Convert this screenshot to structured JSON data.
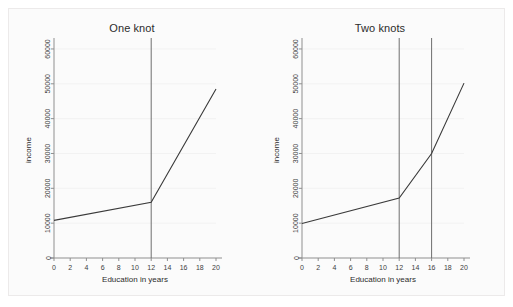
{
  "figure": {
    "background_color": "#fbfbfb",
    "frame_color": "#eceaea",
    "line_color": "#3a3a3a",
    "knot_color": "#6e6e6e",
    "axis_color": "#8f8f8f"
  },
  "panels": [
    {
      "id": "one-knot",
      "title": "One knot"
    },
    {
      "id": "two-knots",
      "title": "Two knots"
    }
  ],
  "axes": {
    "xlabel": "Education in years",
    "ylabel": "income",
    "x_ticks": [
      "0",
      "2",
      "4",
      "6",
      "8",
      "10",
      "12",
      "14",
      "16",
      "18",
      "20"
    ],
    "y_ticks": [
      "0",
      "10000",
      "20000",
      "30000",
      "40000",
      "50000",
      "60000"
    ]
  },
  "chart_data": [
    {
      "type": "line",
      "title": "One knot",
      "xlabel": "Education in years",
      "ylabel": "income",
      "xlim": [
        0,
        20
      ],
      "ylim": [
        0,
        62000
      ],
      "xticks": [
        0,
        2,
        4,
        6,
        8,
        10,
        12,
        14,
        16,
        18,
        20
      ],
      "yticks": [
        0,
        10000,
        20000,
        30000,
        40000,
        50000,
        60000
      ],
      "grid": true,
      "legend": "none",
      "knots": [
        12
      ],
      "series": [
        {
          "name": "piecewise linear spline fit",
          "x": [
            0,
            12,
            20
          ],
          "values": [
            10800,
            16000,
            48500
          ]
        }
      ],
      "annotations": [
        {
          "kind": "vertical-reference-line",
          "x": 12,
          "label": "knot at 12 years"
        }
      ]
    },
    {
      "type": "line",
      "title": "Two knots",
      "xlabel": "Education in years",
      "ylabel": "income",
      "xlim": [
        0,
        20
      ],
      "ylim": [
        0,
        62000
      ],
      "xticks": [
        0,
        2,
        4,
        6,
        8,
        10,
        12,
        14,
        16,
        18,
        20
      ],
      "yticks": [
        0,
        10000,
        20000,
        30000,
        40000,
        50000,
        60000
      ],
      "grid": true,
      "legend": "none",
      "knots": [
        12,
        16
      ],
      "series": [
        {
          "name": "piecewise linear spline fit",
          "x": [
            0,
            12,
            16,
            20
          ],
          "values": [
            9900,
            17200,
            30000,
            50200
          ]
        }
      ],
      "annotations": [
        {
          "kind": "vertical-reference-line",
          "x": 12,
          "label": "knot at 12 years"
        },
        {
          "kind": "vertical-reference-line",
          "x": 16,
          "label": "knot at 16 years"
        }
      ]
    }
  ]
}
